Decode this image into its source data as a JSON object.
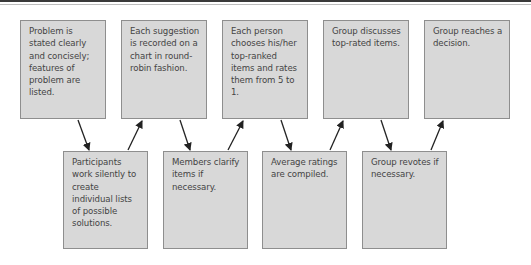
{
  "diagram": {
    "type": "flow",
    "top_steps": [
      {
        "id": "step1",
        "text": "Problem is stated clearly and concisely; features of problem are listed."
      },
      {
        "id": "step3",
        "text": "Each suggestion is recorded on a chart in round-robin fashion."
      },
      {
        "id": "step5",
        "text": "Each person chooses his/her top-ranked items and rates them from 5 to 1."
      },
      {
        "id": "step7",
        "text": "Group discusses top-rated items."
      },
      {
        "id": "step9",
        "text": "Group reaches a decision."
      }
    ],
    "bottom_steps": [
      {
        "id": "step2",
        "text": "Participants work silently to create individual lists of possible solutions."
      },
      {
        "id": "step4",
        "text": "Members clarify items if necessary."
      },
      {
        "id": "step6",
        "text": "Average ratings are compiled."
      },
      {
        "id": "step8",
        "text": "Group revotes if necessary."
      }
    ],
    "edges": [
      [
        "step1",
        "step2"
      ],
      [
        "step2",
        "step3"
      ],
      [
        "step3",
        "step4"
      ],
      [
        "step4",
        "step5"
      ],
      [
        "step5",
        "step6"
      ],
      [
        "step6",
        "step7"
      ],
      [
        "step7",
        "step8"
      ],
      [
        "step8",
        "step9"
      ]
    ],
    "colors": {
      "box_fill": "#d8d8d8",
      "box_border": "#8e8e8e",
      "arrow": "#222222",
      "text": "#444444"
    }
  }
}
